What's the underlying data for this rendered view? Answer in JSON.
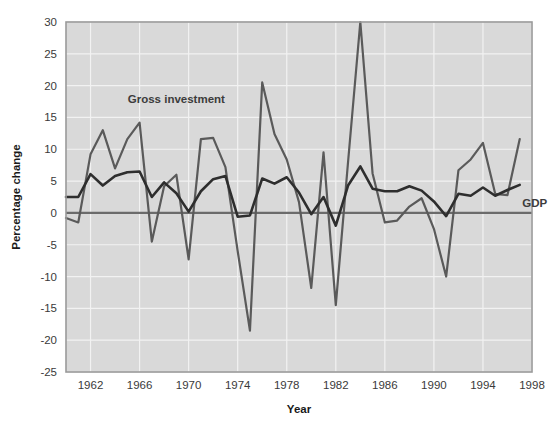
{
  "chart_data": {
    "type": "line",
    "title": "",
    "subtitle": "",
    "xlabel": "Year",
    "ylabel": "Percentage change",
    "xlim": [
      1960,
      1998
    ],
    "ylim": [
      -25,
      30
    ],
    "xticks": [
      "1962",
      "1966",
      "1970",
      "1974",
      "1978",
      "1982",
      "1986",
      "1990",
      "1994",
      "1998"
    ],
    "xtick_values": [
      1962,
      1966,
      1970,
      1974,
      1978,
      1982,
      1986,
      1990,
      1994,
      1998
    ],
    "yticks": [
      "30",
      "25",
      "20",
      "15",
      "10",
      "5",
      "0",
      "-5",
      "-10",
      "-15",
      "-20",
      "-25"
    ],
    "ytick_values": [
      30,
      25,
      20,
      15,
      10,
      5,
      0,
      -5,
      -10,
      -15,
      -20,
      -25
    ],
    "grid": true,
    "grid_color": "#f2f2f2",
    "plot_background": "#d9d9d9",
    "legend_position": "inline-annotations",
    "x": [
      1960,
      1961,
      1962,
      1963,
      1964,
      1965,
      1966,
      1967,
      1968,
      1969,
      1970,
      1971,
      1972,
      1973,
      1974,
      1975,
      1976,
      1977,
      1978,
      1979,
      1980,
      1981,
      1982,
      1983,
      1984,
      1985,
      1986,
      1987,
      1988,
      1989,
      1990,
      1991,
      1992,
      1993,
      1994,
      1995,
      1996,
      1997
    ],
    "series": [
      {
        "name": "GDP",
        "color": "#2e2e2e",
        "line_width": 2.6,
        "label_text": "GDP",
        "label_x": 1997.2,
        "label_y": 1.0,
        "values": [
          2.5,
          2.5,
          6.1,
          4.3,
          5.8,
          6.4,
          6.5,
          2.5,
          4.8,
          3.1,
          0.2,
          3.4,
          5.3,
          5.8,
          -0.6,
          -0.4,
          5.4,
          4.6,
          5.6,
          3.2,
          -0.2,
          2.5,
          -2.0,
          4.3,
          7.3,
          3.8,
          3.4,
          3.4,
          4.2,
          3.5,
          1.8,
          -0.5,
          3.0,
          2.7,
          4.0,
          2.7,
          3.6,
          4.4
        ]
      },
      {
        "name": "Gross investment",
        "color": "#5a5a5a",
        "line_width": 2.2,
        "label_text": "Gross investment",
        "label_x": 1969.0,
        "label_y": 17.2,
        "values": [
          -0.8,
          -1.5,
          9.2,
          13.0,
          7.0,
          11.6,
          14.2,
          -4.5,
          4.2,
          6.0,
          -7.3,
          11.6,
          11.8,
          7.2,
          -6.0,
          -18.5,
          20.5,
          12.4,
          8.4,
          1.7,
          -11.8,
          9.5,
          -14.5,
          8.0,
          30.0,
          6.2,
          -1.5,
          -1.2,
          1.0,
          2.3,
          -2.5,
          -10.0,
          6.7,
          8.4,
          11.0,
          3.0,
          2.8,
          11.6
        ]
      }
    ],
    "zero_line": {
      "value": 0,
      "color": "#6b6b6b",
      "width": 2.4
    }
  }
}
